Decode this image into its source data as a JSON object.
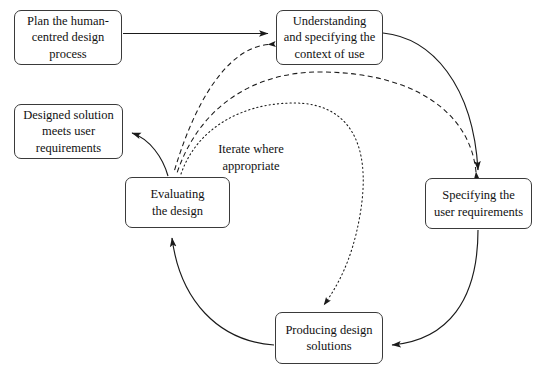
{
  "diagram": {
    "background_color": "#ffffff",
    "line_color": "#1a1a1a",
    "box_border_color": "#3a3a3a",
    "text_color": "#111111",
    "nodes": [
      {
        "id": "plan",
        "label": "Plan the human-\ncentred design\nprocess",
        "x": 14,
        "y": 10,
        "width": 108,
        "height": 55
      },
      {
        "id": "understand",
        "label": "Understanding\nand specifying the\ncontext of use",
        "x": 276,
        "y": 10,
        "width": 107,
        "height": 55
      },
      {
        "id": "designed-solution",
        "label": "Designed solution\nmeets user\nrequirements",
        "x": 14,
        "y": 104,
        "width": 109,
        "height": 55
      },
      {
        "id": "specifying",
        "label": "Specifying the\nuser requirements",
        "x": 425,
        "y": 178,
        "width": 107,
        "height": 51
      },
      {
        "id": "evaluating",
        "label": "Evaluating\nthe design",
        "x": 125,
        "y": 177,
        "width": 105,
        "height": 51
      },
      {
        "id": "producing",
        "label": "Producing design\nsolutions",
        "x": 275,
        "y": 312,
        "width": 108,
        "height": 52
      }
    ],
    "annotations": [
      {
        "id": "iterate-note",
        "text": "Iterate where\nappropriate",
        "x": 205,
        "y": 124,
        "width": 92
      }
    ],
    "edges": [
      {
        "id": "plan-to-understand",
        "from": "plan",
        "to": "understand",
        "style": "solid",
        "arrow": true
      },
      {
        "id": "understand-to-specifying",
        "from": "understand",
        "to": "specifying",
        "style": "solid",
        "arrow": true
      },
      {
        "id": "specifying-to-producing",
        "from": "specifying",
        "to": "producing",
        "style": "solid",
        "arrow": true
      },
      {
        "id": "producing-to-evaluating",
        "from": "producing",
        "to": "evaluating",
        "style": "solid",
        "arrow": true
      },
      {
        "id": "evaluating-to-designed-solution",
        "from": "evaluating",
        "to": "designed-solution",
        "style": "solid",
        "arrow": true
      },
      {
        "id": "evaluating-to-understand-iterate",
        "from": "evaluating",
        "to": "understand",
        "style": "dashed",
        "arrow": true
      },
      {
        "id": "evaluating-to-specifying-iterate",
        "from": "evaluating",
        "to": "specifying",
        "style": "dashed",
        "arrow": true
      },
      {
        "id": "evaluating-to-producing-iterate",
        "from": "evaluating",
        "to": "producing",
        "style": "dotted",
        "arrow": true
      }
    ]
  }
}
